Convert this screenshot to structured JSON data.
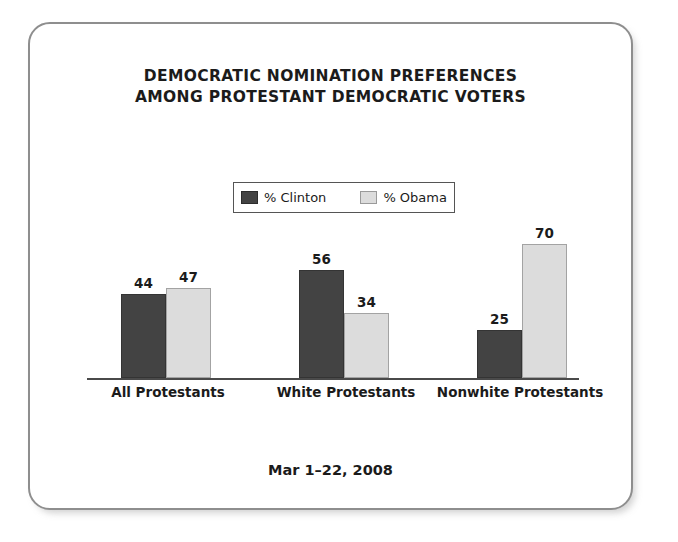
{
  "card": {
    "border_color": "#8e8e8e",
    "background": "#ffffff"
  },
  "title": {
    "line1": "DEMOCRATIC NOMINATION PREFERENCES",
    "line2": "AMONG PROTESTANT DEMOCRATIC VOTERS"
  },
  "legend": {
    "entries": [
      {
        "label": "% Clinton",
        "color": "#434343",
        "swatch": "clinton-swatch"
      },
      {
        "label": "% Obama",
        "color": "#dcdcdc",
        "swatch": "obama-swatch"
      }
    ]
  },
  "footer": {
    "date_range": "Mar 1–22, 2008"
  },
  "chart_data": {
    "type": "bar",
    "title": "DEMOCRATIC NOMINATION PREFERENCES AMONG PROTESTANT DEMOCRATIC VOTERS",
    "subtitle": "Mar 1–22, 2008",
    "xlabel": "",
    "ylabel": "",
    "ylim": [
      0,
      75
    ],
    "grid": false,
    "legend_position": "top-center",
    "axis": {
      "baseline_only": true,
      "tick_labels": []
    },
    "categories": [
      "All Protestants",
      "White Protestants",
      "Nonwhite Protestants"
    ],
    "series": [
      {
        "name": "% Clinton",
        "color": "#434343",
        "values": [
          44,
          56,
          25
        ]
      },
      {
        "name": "% Obama",
        "color": "#dcdcdc",
        "values": [
          47,
          34,
          70
        ]
      }
    ],
    "data_labels": [
      {
        "category": "All Protestants",
        "clinton": 44,
        "obama": 47
      },
      {
        "category": "White Protestants",
        "clinton": 56,
        "obama": 34
      },
      {
        "category": "Nonwhite Protestants",
        "clinton": 25,
        "obama": 70
      }
    ]
  }
}
